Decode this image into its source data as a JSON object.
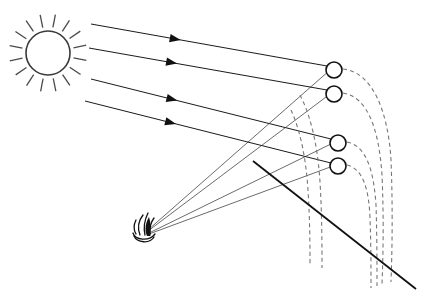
{
  "figure": {
    "domain": "Diagram",
    "background_color": "#ffffff",
    "width": 430,
    "height": 305
  },
  "palette": {
    "ink": "#111111",
    "sun_outline": "#3a3a3a",
    "sun_spike": "#4a4a4a",
    "ray": "#1a1a1a",
    "thin_ray": "#2b2b2b",
    "dashed_curve": "#777777",
    "ground": "#111111",
    "sphere_fill": "#ffffff"
  },
  "sun": {
    "name": "sun",
    "center_x": 48,
    "center_y": 53,
    "radius": 22,
    "spike_count": 16,
    "spike_inner": 26,
    "spike_outer": 39
  },
  "fire": {
    "name": "fire",
    "x": 146,
    "y": 231,
    "label": ""
  },
  "sun_rays": [
    {
      "x1": 91,
      "y1": 24,
      "x2": 327,
      "y2": 66,
      "arrow_t": 0.38
    },
    {
      "x1": 89,
      "y1": 48,
      "x2": 327,
      "y2": 90,
      "arrow_t": 0.37
    },
    {
      "x1": 91,
      "y1": 79,
      "x2": 331,
      "y2": 139,
      "arrow_t": 0.36
    },
    {
      "x1": 85,
      "y1": 101,
      "x2": 331,
      "y2": 163,
      "arrow_t": 0.37
    }
  ],
  "fire_rays": [
    {
      "x1": 148,
      "y1": 230,
      "x2": 330,
      "y2": 70
    },
    {
      "x1": 148,
      "y1": 231,
      "x2": 330,
      "y2": 94
    },
    {
      "x1": 149,
      "y1": 233,
      "x2": 333,
      "y2": 143
    },
    {
      "x1": 149,
      "y1": 234,
      "x2": 333,
      "y2": 166
    }
  ],
  "spheres": [
    {
      "id": "sphere-1",
      "cx": 334,
      "cy": 70,
      "r": 8
    },
    {
      "id": "sphere-2",
      "cx": 334,
      "cy": 94,
      "r": 8
    },
    {
      "id": "sphere-3",
      "cx": 338,
      "cy": 143,
      "r": 8
    },
    {
      "id": "sphere-4",
      "cx": 338,
      "cy": 166,
      "r": 8
    }
  ],
  "trajectories": [
    {
      "id": "traj-1",
      "path": "M 343 69 C 372 72, 388 110, 391 160 C 393 210, 392 255, 391 282"
    },
    {
      "id": "traj-2",
      "path": "M 343 93 C 368 97, 379 130, 382 175 C 384 220, 383 258, 382 284"
    },
    {
      "id": "traj-3",
      "path": "M 347 142 C 368 146, 374 175, 376 205 C 377 235, 377 266, 377 286"
    },
    {
      "id": "traj-4",
      "path": "M 347 165 C 364 169, 369 192, 370 218 C 371 244, 371 270, 371 288"
    },
    {
      "id": "traj-5",
      "path": "M 300 95 C 312 118, 318 150, 320 182 C 322 214, 322 248, 322 268"
    },
    {
      "id": "traj-6",
      "path": "M 291 110 C 301 132, 306 160, 308 190 C 310 220, 310 250, 310 266"
    }
  ],
  "ground": {
    "id": "ground-line",
    "x1": 253,
    "y1": 161,
    "x2": 416,
    "y2": 289
  },
  "chart_data": {
    "type": "diagram",
    "elements": [
      "sun with 16 radiating spikes at upper-left",
      "four parallel arrowed sun rays travelling down-right",
      "fire/torch at lower-left-centre",
      "four thin fire rays converging from the fire up to the spheres",
      "four small open circles (spheres) on the right",
      "six dashed arcing trajectory curves descending from the spheres",
      "one solid diagonal ground line from upper-left to lower-right"
    ]
  }
}
